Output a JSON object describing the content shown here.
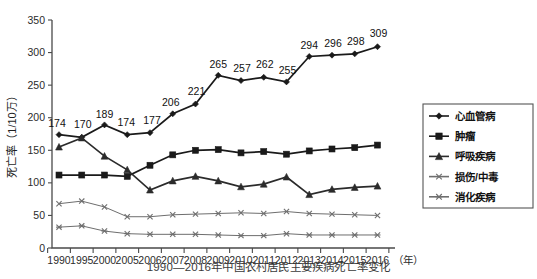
{
  "chart_data": {
    "type": "line",
    "title": "",
    "caption": "1990—2016年中国农村居民主要疾病死亡率变化",
    "xlabel": "（年）",
    "ylabel": "死亡率（1/10万）",
    "categories": [
      "1990",
      "1995",
      "2000",
      "2005",
      "2006",
      "2007",
      "2008",
      "2009",
      "2010",
      "2011",
      "2012",
      "2013",
      "2014",
      "2015",
      "2016"
    ],
    "ylim": [
      0,
      350
    ],
    "yticks": [
      "0",
      "50",
      "100",
      "150",
      "200",
      "250",
      "300",
      "350"
    ],
    "grid": false,
    "legend_position": "right",
    "series": [
      {
        "name": "心血管病",
        "marker": "diamond",
        "color": "#1a1a1a",
        "labeled": true,
        "values": [
          174,
          170,
          189,
          174,
          177,
          206,
          221,
          265,
          257,
          262,
          255,
          294,
          296,
          298,
          309
        ],
        "data_labels": [
          "174",
          "170",
          "189",
          "174",
          "177",
          "206",
          "221",
          "265",
          "257",
          "262",
          "255",
          "294",
          "296",
          "298",
          "309"
        ]
      },
      {
        "name": "肿瘤",
        "marker": "square",
        "color": "#1a1a1a",
        "labeled": false,
        "values": [
          112,
          112,
          112,
          110,
          127,
          143,
          150,
          151,
          146,
          148,
          144,
          149,
          152,
          154,
          158
        ]
      },
      {
        "name": "呼吸疾病",
        "marker": "triangle",
        "color": "#2b2b2b",
        "labeled": false,
        "values": [
          155,
          169,
          141,
          120,
          89,
          103,
          110,
          103,
          94,
          98,
          109,
          82,
          90,
          93,
          95
        ]
      },
      {
        "name": "损伤/中毒",
        "marker": "cross",
        "color": "#6e6e6e",
        "labeled": false,
        "values": [
          68,
          72,
          63,
          48,
          48,
          51,
          52,
          53,
          54,
          53,
          56,
          53,
          52,
          51,
          50
        ]
      },
      {
        "name": "消化疾病",
        "marker": "star",
        "color": "#6e6e6e",
        "labeled": false,
        "values": [
          32,
          34,
          26,
          22,
          21,
          21,
          21,
          20,
          19,
          19,
          22,
          20,
          20,
          20,
          20
        ]
      }
    ]
  },
  "legend": {
    "items": [
      {
        "label": "心血管病",
        "marker": "diamond"
      },
      {
        "label": "肿瘤",
        "marker": "square"
      },
      {
        "label": "呼吸疾病",
        "marker": "triangle"
      },
      {
        "label": "损伤/中毒",
        "marker": "cross"
      },
      {
        "label": "消化疾病",
        "marker": "star"
      }
    ]
  }
}
